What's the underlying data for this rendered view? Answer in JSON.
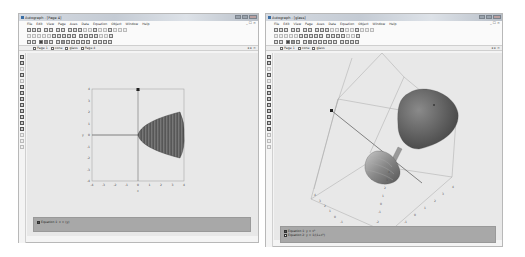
{
  "windows": [
    {
      "title": "Autograph - [Page 4]",
      "menu": [
        "File",
        "Edit",
        "View",
        "Page",
        "Axes",
        "Data",
        "Equation",
        "Object",
        "Window",
        "Help"
      ],
      "mdi_controls": "_ ☐ ×",
      "tabs": [
        {
          "label": "Page 1"
        },
        {
          "label": "cone"
        },
        {
          "label": "glass"
        },
        {
          "label": "Page 4"
        }
      ],
      "tab_controls": "◂ ▸ ×",
      "status": [
        {
          "label": "Equation 1: x = (y)",
          "checked": true
        }
      ],
      "plot": {
        "type": "2D",
        "x_ticks": [
          "-4",
          "-3",
          "-2",
          "-1",
          "0",
          "1",
          "2",
          "3",
          "4"
        ],
        "y_ticks": [
          "4",
          "3",
          "2",
          "1",
          "0",
          "-1",
          "-2",
          "-3",
          "-4"
        ],
        "x_label": "x",
        "y_label": "y"
      }
    },
    {
      "title": "Autograph - [glass]",
      "menu": [
        "File",
        "Edit",
        "View",
        "Page",
        "Axes",
        "Data",
        "Equation",
        "Object",
        "Window",
        "Help"
      ],
      "mdi_controls": "_ ☐ ×",
      "tabs": [
        {
          "label": "Page 1"
        },
        {
          "label": "cone"
        },
        {
          "label": "glass"
        }
      ],
      "tab_controls": "◂ ▸ ×",
      "status": [
        {
          "label": "Equation 1: y = x²",
          "checked": true
        },
        {
          "label": "Equation 2: y = 1/(1+x²)",
          "checked": false
        }
      ],
      "plot": {
        "type": "3D",
        "axis_ticks_a": [
          "4",
          "3",
          "2",
          "1",
          "0",
          "-1",
          "-2"
        ],
        "axis_ticks_b": [
          "4",
          "3",
          "2",
          "1",
          "0",
          "-1",
          "-2"
        ],
        "axis_ticks_z": [
          "4",
          "3",
          "2",
          "1",
          "0",
          "-1",
          "-2"
        ]
      }
    }
  ],
  "colors": {
    "surface_dark": "#5a5a5a",
    "surface_mid": "#7a7a7a",
    "status_bg": "#a8a8a8",
    "canvas_bg": "#e8e8e8"
  }
}
